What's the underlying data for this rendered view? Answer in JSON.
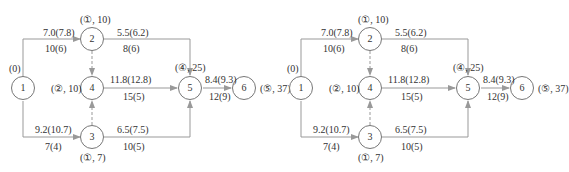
{
  "diagrams": [
    {
      "id": "left",
      "nodes": [
        {
          "id": "1",
          "label": "1",
          "tag": "(0)"
        },
        {
          "id": "2",
          "label": "2",
          "tag": "(①, 10)"
        },
        {
          "id": "3",
          "label": "3",
          "tag": "(①, 7)"
        },
        {
          "id": "4",
          "label": "4",
          "tag": "(②, 10)"
        },
        {
          "id": "5",
          "label": "5",
          "tag": "(④, 25)"
        },
        {
          "id": "6",
          "label": "6",
          "tag": "(⑤, 37)"
        }
      ],
      "edges": [
        {
          "from": "1",
          "to": "2",
          "top": "7.0(7.8)",
          "bottom": "10(6)"
        },
        {
          "from": "1",
          "to": "3",
          "top": "9.2(10.7)",
          "bottom": "7(4)"
        },
        {
          "from": "2",
          "to": "5",
          "top": "5.5(6.2)",
          "bottom": "8(6)"
        },
        {
          "from": "4",
          "to": "5",
          "top": "11.8(12.8)",
          "bottom": "15(5)"
        },
        {
          "from": "3",
          "to": "5",
          "top": "6.5(7.5)",
          "bottom": "10(5)"
        },
        {
          "from": "5",
          "to": "6",
          "top": "8.4(9.3)",
          "bottom": "12(9)"
        },
        {
          "from": "2",
          "to": "4",
          "dashed": true
        },
        {
          "from": "3",
          "to": "4",
          "dashed": true
        }
      ]
    },
    {
      "id": "right",
      "nodes": [
        {
          "id": "1",
          "label": "1",
          "tag": "(0)"
        },
        {
          "id": "2",
          "label": "2",
          "tag": "(①, 10)"
        },
        {
          "id": "3",
          "label": "3",
          "tag": "(①, 7)"
        },
        {
          "id": "4",
          "label": "4",
          "tag": "(②, 10)"
        },
        {
          "id": "5",
          "label": "5",
          "tag": "(④, 25)"
        },
        {
          "id": "6",
          "label": "6",
          "tag": "(⑤, 37)"
        }
      ],
      "edges": [
        {
          "from": "1",
          "to": "2",
          "top": "7.0(7.8)",
          "bottom": "10(6)"
        },
        {
          "from": "1",
          "to": "3",
          "top": "9.2(10.7)",
          "bottom": "7(4)"
        },
        {
          "from": "2",
          "to": "5",
          "top": "5.5(6.2)",
          "bottom": "8(6)"
        },
        {
          "from": "4",
          "to": "5",
          "top": "11.8(12.8)",
          "bottom": "15(5)"
        },
        {
          "from": "3",
          "to": "5",
          "top": "6.5(7.5)",
          "bottom": "10(5)"
        },
        {
          "from": "5",
          "to": "6",
          "top": "8.4(9.3)",
          "bottom": "12(9)"
        },
        {
          "from": "2",
          "to": "4",
          "dashed": true
        },
        {
          "from": "3",
          "to": "4",
          "dashed": true
        }
      ]
    }
  ]
}
